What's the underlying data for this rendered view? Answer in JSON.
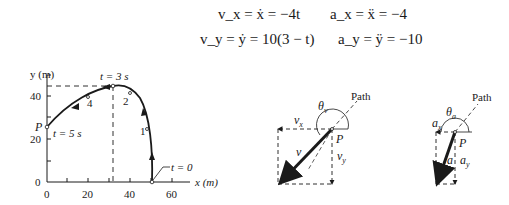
{
  "equations": {
    "vx": "v_x = ẋ = −4t",
    "ax": "a_x = ẍ = −4",
    "vy": "v_y = ẏ = 10(3 − t)",
    "ay": "a_y = ÿ = −10"
  },
  "graph": {
    "y_axis_label": "y (m)",
    "x_axis_label": "x (m)",
    "y_ticks": [
      "0",
      "20",
      "40"
    ],
    "x_ticks": [
      "0",
      "20",
      "40",
      "60"
    ],
    "labels": {
      "t3": "t = 3 s",
      "t5": "t = 5 s",
      "t0": "t = 0",
      "P": "P",
      "m1": "1",
      "m2": "2",
      "m4": "4"
    }
  },
  "velocity_diagram": {
    "path": "Path",
    "theta": "θ",
    "theta_sub": "v",
    "vx": "v",
    "vx_sub": "x",
    "vy": "v",
    "vy_sub": "y",
    "v": "v",
    "P": "P"
  },
  "acceleration_diagram": {
    "path": "Path",
    "theta": "θ",
    "theta_sub": "a",
    "ax": "a",
    "ax_sub": "x",
    "ay": "a",
    "ay_sub": "y",
    "a": "a",
    "P": "P"
  }
}
